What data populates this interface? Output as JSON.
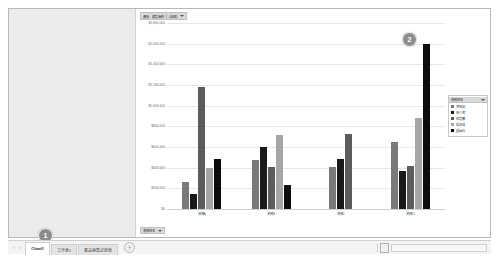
{
  "app": {
    "type": "spreadsheet-chart-sheet"
  },
  "chart_header": {
    "label": "產品　銷售金額",
    "filter_label": "(全部)",
    "caret": "▼"
  },
  "chart_footer": {
    "label": "業務姓名",
    "caret": "▼"
  },
  "legend": {
    "title": "業務姓名",
    "caret": "▼",
    "items": [
      {
        "label": "李怡如",
        "color": "#7a7a7a"
      },
      {
        "label": "林少明",
        "color": "#1a1a1a"
      },
      {
        "label": "林嘉蓁",
        "color": "#5c5c5c"
      },
      {
        "label": "楊志成",
        "color": "#a6a6a6"
      },
      {
        "label": "鍾國元",
        "color": "#0d0d0d"
      }
    ]
  },
  "annotations": [
    {
      "name": "badge-1",
      "text": "1"
    },
    {
      "name": "badge-2",
      "text": "2"
    }
  ],
  "tabbar": {
    "nav_prev": "‹",
    "nav_next": "›",
    "add_label": "＋",
    "tabs": [
      {
        "label": "Chart1",
        "active": true
      },
      {
        "label": "工作表1",
        "active": false
      },
      {
        "label": "產品銷售記錄表",
        "active": false
      }
    ],
    "scroll_grip": "◄►"
  },
  "chart_data": {
    "type": "bar",
    "title": "產品　銷售金額",
    "xlabel": "",
    "ylabel": "",
    "ylim": [
      0,
      1800000
    ],
    "grid": true,
    "legend_position": "right",
    "ytick_labels": [
      "$1,800,000",
      "$1,600,000",
      "$1,400,000",
      "$1,200,000",
      "$1,000,000",
      "$800,000",
      "$600,000",
      "$400,000",
      "$200,000",
      "$0"
    ],
    "ytick_values": [
      1800000,
      1600000,
      1400000,
      1200000,
      1000000,
      800000,
      600000,
      400000,
      200000,
      0
    ],
    "categories": [
      "業務A",
      "業務B",
      "業務C",
      "業務D"
    ],
    "series": [
      {
        "name": "李怡如",
        "color": "#7a7a7a",
        "values": [
          260000,
          470000,
          410000,
          650000
        ]
      },
      {
        "name": "林少明",
        "color": "#1a1a1a",
        "values": [
          150000,
          600000,
          480000,
          370000
        ]
      },
      {
        "name": "林嘉蓁",
        "color": "#5c5c5c",
        "values": [
          1180000,
          410000,
          730000,
          420000
        ]
      },
      {
        "name": "楊志成",
        "color": "#a6a6a6",
        "values": [
          400000,
          720000,
          null,
          880000
        ]
      },
      {
        "name": "鍾國元",
        "color": "#0d0d0d",
        "values": [
          480000,
          230000,
          null,
          1600000
        ]
      }
    ]
  }
}
